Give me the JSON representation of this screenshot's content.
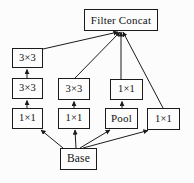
{
  "diagram": {
    "name": "inception-module-block-diagram",
    "background": "#fcfcfc",
    "box_fill": "#fdfdfd",
    "line_color": "#1b1b1b",
    "text_color": "#111111",
    "nodes": [
      {
        "id": "filter-concat",
        "label": "Filter Concat",
        "x": 84,
        "y": 9,
        "w": 74,
        "h": 22,
        "font": 11
      },
      {
        "id": "branch1-conv3x3-top",
        "label": "3×3",
        "x": 12,
        "y": 48,
        "w": 31,
        "h": 20,
        "font": 10.5
      },
      {
        "id": "branch1-conv3x3-mid",
        "label": "3×3",
        "x": 12,
        "y": 78,
        "w": 31,
        "h": 21,
        "font": 10.5
      },
      {
        "id": "branch1-conv1x1",
        "label": "1×1",
        "x": 12,
        "y": 108,
        "w": 31,
        "h": 21,
        "font": 10.5
      },
      {
        "id": "branch2-conv3x3",
        "label": "3×3",
        "x": 58,
        "y": 78,
        "w": 32,
        "h": 22,
        "font": 10.5
      },
      {
        "id": "branch2-conv1x1",
        "label": "1×1",
        "x": 58,
        "y": 108,
        "w": 32,
        "h": 21,
        "font": 10.5
      },
      {
        "id": "branch3-conv1x1",
        "label": "1×1",
        "x": 110,
        "y": 79,
        "w": 33,
        "h": 21,
        "font": 10.5
      },
      {
        "id": "branch3-pool",
        "label": "Pool",
        "x": 105,
        "y": 108,
        "w": 33,
        "h": 21,
        "font": 11
      },
      {
        "id": "branch4-conv1x1",
        "label": "1×1",
        "x": 147,
        "y": 108,
        "w": 33,
        "h": 22,
        "font": 10.5
      },
      {
        "id": "base",
        "label": "Base",
        "x": 60,
        "y": 148,
        "w": 37,
        "h": 22,
        "font": 11.5
      }
    ],
    "edges": [
      {
        "from": "branch1-conv3x3-mid",
        "to": "branch1-conv3x3-top",
        "x1": 27,
        "y1": 78,
        "x2": 27,
        "y2": 69.5
      },
      {
        "from": "branch1-conv1x1",
        "to": "branch1-conv3x3-mid",
        "x1": 27,
        "y1": 108,
        "x2": 27,
        "y2": 100.5
      },
      {
        "from": "branch2-conv1x1",
        "to": "branch2-conv3x3",
        "x1": 74,
        "y1": 108,
        "x2": 74,
        "y2": 101.5
      },
      {
        "from": "branch3-pool",
        "to": "branch3-conv1x1",
        "x1": 122,
        "y1": 108,
        "x2": 122,
        "y2": 101.5
      },
      {
        "from": "branch1-conv3x3-top",
        "to": "filter-concat",
        "x1": 43,
        "y1": 49,
        "x2": 118,
        "y2": 32
      },
      {
        "from": "branch2-conv3x3",
        "to": "filter-concat",
        "x1": 75,
        "y1": 78,
        "x2": 120,
        "y2": 32
      },
      {
        "from": "branch3-conv1x1",
        "to": "filter-concat",
        "x1": 121,
        "y1": 79,
        "x2": 121,
        "y2": 32
      },
      {
        "from": "branch4-conv1x1",
        "to": "filter-concat",
        "x1": 163,
        "y1": 108,
        "x2": 123,
        "y2": 32
      },
      {
        "from": "base",
        "to": "branch1-conv1x1",
        "x1": 63,
        "y1": 148,
        "x2": 41,
        "y2": 130
      },
      {
        "from": "base",
        "to": "branch2-conv1x1",
        "x1": 76,
        "y1": 148,
        "x2": 75,
        "y2": 130
      },
      {
        "from": "base",
        "to": "branch3-pool",
        "x1": 80,
        "y1": 148,
        "x2": 110,
        "y2": 130
      },
      {
        "from": "base",
        "to": "branch4-conv1x1",
        "x1": 83,
        "y1": 148,
        "x2": 148,
        "y2": 130.5
      }
    ]
  }
}
